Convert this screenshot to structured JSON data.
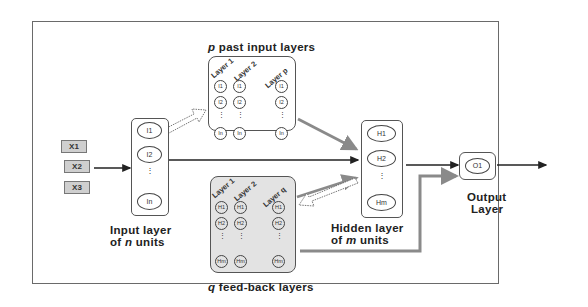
{
  "diagram": {
    "title_top": {
      "prefix": "p",
      "text": " past input layers"
    },
    "title_bottom": {
      "prefix": "q",
      "text": " feed-back layers"
    },
    "inputs": [
      "X1",
      "X2",
      "X3"
    ],
    "input_layer": {
      "nodes": [
        "I1",
        "I2",
        "In"
      ],
      "ellipsis": "⋮",
      "caption_line1": "Input layer",
      "caption_line2_prefix": "of ",
      "caption_line2_var": "n",
      "caption_line2_suffix": " units"
    },
    "past_input_layers": {
      "column_headers": [
        "Layer 1",
        "Layer 2",
        "Layer p"
      ],
      "nodes": [
        "I1",
        "I2",
        "In"
      ]
    },
    "feedback_layers": {
      "column_headers": [
        "Layer 1",
        "Layer 2",
        "Layer q"
      ],
      "nodes": [
        "H1",
        "H2",
        "Hm"
      ]
    },
    "hidden_layer": {
      "nodes": [
        "H1",
        "H2",
        "Hm"
      ],
      "caption_line1": "Hidden layer",
      "caption_line2_prefix": "of ",
      "caption_line2_var": "m",
      "caption_line2_suffix": " units"
    },
    "output_layer": {
      "nodes": [
        "O1"
      ],
      "caption_line1": "Output",
      "caption_line2": "Layer"
    },
    "colors": {
      "border": "#555555",
      "gray_arrow": "#8a8a8a",
      "feedback_fill": "#e3e3e3",
      "input_box_fill": "#cfcfcf"
    }
  }
}
